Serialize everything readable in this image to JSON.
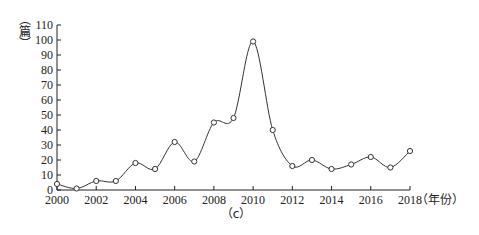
{
  "chart_data": {
    "type": "line",
    "title": "",
    "caption": "（c）",
    "xlabel": "（年份）",
    "ylabel": "（篇）",
    "ylabel_chars": [
      "︵",
      "篇",
      "︶"
    ],
    "x": [
      2000,
      2001,
      2002,
      2003,
      2004,
      2005,
      2006,
      2007,
      2008,
      2009,
      2010,
      2011,
      2012,
      2013,
      2014,
      2015,
      2016,
      2017,
      2018
    ],
    "series": [
      {
        "name": "篇数",
        "values": [
          4,
          1,
          6,
          6,
          18,
          14,
          32,
          19,
          45,
          48,
          99,
          40,
          16,
          20,
          14,
          17,
          22,
          15,
          26
        ]
      }
    ],
    "xticks": [
      2000,
      2002,
      2004,
      2006,
      2008,
      2010,
      2012,
      2014,
      2016,
      2018
    ],
    "yticks": [
      0,
      10,
      20,
      30,
      40,
      50,
      60,
      70,
      80,
      90,
      100,
      110
    ],
    "xlim": [
      2000,
      2018
    ],
    "ylim": [
      0,
      110
    ],
    "grid": false,
    "legend": null,
    "line_style": "smooth",
    "marker": "open-circle"
  }
}
